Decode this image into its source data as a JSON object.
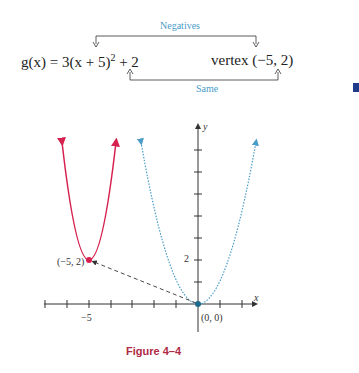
{
  "equation": {
    "function_name": "g",
    "variable": "x",
    "text_prefix": "g(x) = 3(x + 5)",
    "exponent": "2",
    "text_suffix": " + 2"
  },
  "vertex_label": "vertex (−5, 2)",
  "annotations": {
    "top": "Negatives",
    "bottom": "Same"
  },
  "graph": {
    "x_axis_label": "x",
    "y_axis_label": "y",
    "x_tick_label": "−5",
    "y_tick_label": "2",
    "point_vertex_label": "(−5, 2)",
    "point_origin_label": "(0, 0)",
    "colors": {
      "transformed": "#d6204e",
      "parent": "#4a9cc7",
      "axis": "#333333"
    }
  },
  "caption": "Figure 4–4"
}
